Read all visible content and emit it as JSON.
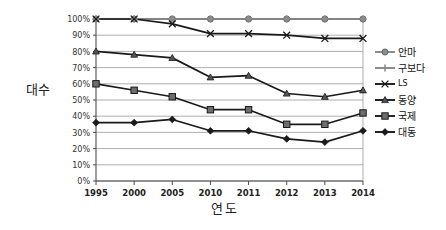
{
  "chart_data": {
    "type": "line",
    "title": "",
    "xlabel": "연도",
    "ylabel": "대수",
    "categories": [
      "1995",
      "2000",
      "2005",
      "2010",
      "2011",
      "2012",
      "2013",
      "2014"
    ],
    "ylim": [
      0,
      100
    ],
    "ytick_labels": [
      "100%",
      "90%",
      "80%",
      "70%",
      "60%",
      "50%",
      "40%",
      "30%",
      "20%",
      "10%",
      "0%"
    ],
    "ytick_values": [
      100,
      90,
      80,
      70,
      60,
      50,
      40,
      30,
      20,
      10,
      0
    ],
    "grid": true,
    "legend_position": "right",
    "value_unit": "%",
    "series": [
      {
        "name": "안마",
        "marker": "circle",
        "color": "#808080",
        "values": [
          100,
          100,
          100,
          100,
          100,
          100,
          100,
          100
        ]
      },
      {
        "name": "구보다",
        "marker": "plus-bar",
        "color": "#808080",
        "values": [
          100,
          100,
          100,
          100,
          100,
          100,
          100,
          100
        ]
      },
      {
        "name": "LS",
        "marker": "x",
        "color": "#1a1a1a",
        "values": [
          100,
          100,
          97,
          91,
          91,
          90,
          88,
          88
        ]
      },
      {
        "name": "동양",
        "marker": "triangle",
        "color": "#1a1a1a",
        "values": [
          80,
          78,
          76,
          64,
          65,
          54,
          52,
          56
        ]
      },
      {
        "name": "국제",
        "marker": "square",
        "color": "#1a1a1a",
        "values": [
          60,
          56,
          52,
          44,
          44,
          35,
          35,
          42
        ]
      },
      {
        "name": "대동",
        "marker": "diamond",
        "color": "#1a1a1a",
        "values": [
          36,
          36,
          38,
          31,
          31,
          26,
          24,
          31
        ]
      }
    ]
  }
}
